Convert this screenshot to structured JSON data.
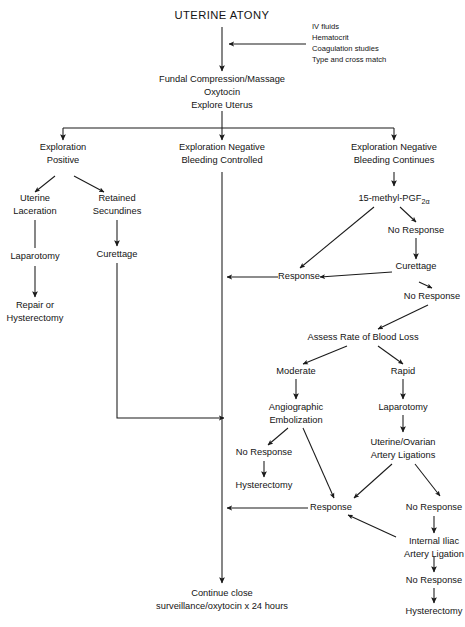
{
  "diagram": {
    "title": "UTERINE ATONY",
    "type": "clinical-management-flowchart",
    "width": 465,
    "height": 627,
    "background_color": "#ffffff",
    "line_color": "#1a1a1a",
    "text_color": "#141414"
  },
  "side_note": {
    "name": "initial-resuscitation-measures",
    "lines": [
      "IV fluids",
      "Hematocrit",
      "Coagulation studies",
      "Type and cross match"
    ]
  },
  "nodes": {
    "title": "UTERINE ATONY",
    "initial_management_line1": "Fundal Compression/Massage",
    "initial_management_line2": "Oxytocin",
    "initial_management_line3": "Explore Uterus",
    "exploration_positive_line1": "Exploration",
    "exploration_positive_line2": "Positive",
    "exploration_neg_controlled_line1": "Exploration Negative",
    "exploration_neg_controlled_line2": "Bleeding Controlled",
    "exploration_neg_continues_line1": "Exploration Negative",
    "exploration_neg_continues_line2": "Bleeding Continues",
    "uterine_laceration_line1": "Uterine",
    "uterine_laceration_line2": "Laceration",
    "retained_secundines_line1": "Retained",
    "retained_secundines_line2": "Secundines",
    "laparotomy_left": "Laparotomy",
    "curettage_left": "Curettage",
    "repair_or_line1": "Repair or",
    "repair_or_line2": "Hysterectomy",
    "prostaglandin_base": "15-methyl-PGF",
    "prostaglandin_subscript": "2α",
    "no_response_1": "No Response",
    "curettage_right": "Curettage",
    "no_response_2": "No Response",
    "response_upper": "Response",
    "assess_blood_loss": "Assess Rate of Blood Loss",
    "moderate": "Moderate",
    "rapid": "Rapid",
    "angiographic_embolization_line1": "Angiographic",
    "angiographic_embolization_line2": "Embolization",
    "laparotomy_right": "Laparotomy",
    "no_response_3": "No Response",
    "hysterectomy_mid": "Hysterectomy",
    "uterine_ovarian_line1": "Uterine/Ovarian",
    "uterine_ovarian_line2": "Artery Ligations",
    "response_lower": "Response",
    "no_response_4": "No Response",
    "internal_iliac_line1": "Internal Iliac",
    "internal_iliac_line2": "Artery Ligation",
    "no_response_5": "No Response",
    "hysterectomy_final": "Hysterectomy",
    "outcome_line1": "Continue close",
    "outcome_line2": "surveillance/oxytocin x 24 hours"
  }
}
